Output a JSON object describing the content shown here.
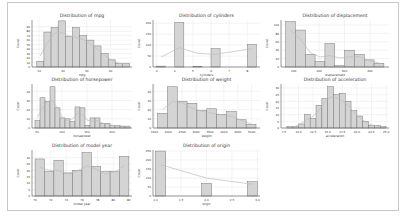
{
  "chart_data": [
    {
      "type": "bar",
      "title": "Distribution of mpg",
      "xlabel": "mpg",
      "ylabel": "Count",
      "bin_edges": [
        9,
        12.8,
        16.6,
        20.4,
        24.2,
        28,
        31.8,
        35.6,
        39.4,
        43.2,
        47
      ],
      "values": [
        13,
        78,
        88,
        103,
        68,
        88,
        70,
        60,
        47,
        30,
        16,
        8,
        8
      ],
      "bins": [
        [
          9,
          12
        ],
        [
          12,
          15
        ],
        [
          15,
          18
        ],
        [
          18,
          21
        ],
        [
          21,
          24
        ],
        [
          24,
          27
        ],
        [
          27,
          30
        ],
        [
          30,
          33
        ],
        [
          33,
          36
        ],
        [
          36,
          39
        ],
        [
          39,
          42
        ],
        [
          42,
          45
        ],
        [
          45,
          48
        ]
      ],
      "xticks": [
        "10",
        "20",
        "30",
        "40"
      ],
      "xtick_values": [
        10,
        20,
        30,
        40
      ],
      "yticks": [
        "0",
        "10",
        "20",
        "30",
        "40",
        "50",
        "60",
        "70",
        "80",
        "90"
      ],
      "ylim": [
        0,
        105
      ],
      "xlim": [
        7,
        49
      ],
      "kde": true
    },
    {
      "type": "bar",
      "title": "Distribution of cylinders",
      "xlabel": "cylinders",
      "ylabel": "Count",
      "bins": [
        [
          3,
          3.5
        ],
        [
          4,
          4.5
        ],
        [
          5,
          5.5
        ],
        [
          6,
          6.5
        ],
        [
          8,
          8.5
        ]
      ],
      "values": [
        4,
        204,
        3,
        84,
        103
      ],
      "xticks": [
        "3",
        "4",
        "5",
        "6",
        "7",
        "8"
      ],
      "xtick_values": [
        3,
        4,
        5,
        6,
        7,
        8
      ],
      "yticks": [
        "0",
        "50",
        "100",
        "150",
        "200"
      ],
      "ylim": [
        0,
        215
      ],
      "xlim": [
        2.8,
        8.7
      ],
      "kde": true
    },
    {
      "type": "bar",
      "title": "Distribution of displacement",
      "xlabel": "displacement",
      "ylabel": "Count",
      "bins": [
        [
          68,
          106.7
        ],
        [
          106.7,
          145.4
        ],
        [
          145.4,
          184.1
        ],
        [
          184.1,
          222.8
        ],
        [
          222.8,
          261.5
        ],
        [
          261.5,
          300.2
        ],
        [
          300.2,
          338.9
        ],
        [
          338.9,
          377.6
        ],
        [
          377.6,
          416.3
        ],
        [
          416.3,
          455
        ]
      ],
      "values": [
        108,
        88,
        30,
        13,
        56,
        3,
        40,
        30,
        17,
        9
      ],
      "xticks": [
        "100",
        "200",
        "300",
        "400"
      ],
      "xtick_values": [
        100,
        200,
        300,
        400
      ],
      "yticks": [
        "0",
        "20",
        "40",
        "60",
        "80",
        "100"
      ],
      "ylim": [
        0,
        112
      ],
      "xlim": [
        50,
        475
      ],
      "kde": true
    },
    {
      "type": "bar",
      "title": "Distribution of horsepower",
      "xlabel": "horsepower",
      "ylabel": "Count",
      "bins": [
        [
          46,
          56
        ],
        [
          56,
          66
        ],
        [
          66,
          76
        ],
        [
          76,
          86
        ],
        [
          86,
          96
        ],
        [
          96,
          106
        ],
        [
          106,
          116
        ],
        [
          116,
          126
        ],
        [
          126,
          136
        ],
        [
          136,
          146
        ],
        [
          146,
          156
        ],
        [
          156,
          166
        ],
        [
          166,
          176
        ],
        [
          176,
          186
        ],
        [
          186,
          196
        ],
        [
          196,
          206
        ],
        [
          206,
          216
        ],
        [
          216,
          226
        ],
        [
          226,
          236
        ]
      ],
      "values": [
        8,
        33,
        29,
        45,
        22,
        11,
        10,
        7,
        23,
        22,
        3,
        11,
        11,
        5,
        5,
        3,
        3,
        2,
        2
      ],
      "xticks": [
        "50",
        "100",
        "150",
        "200"
      ],
      "xtick_values": [
        50,
        100,
        150,
        200
      ],
      "yticks": [
        "0",
        "10",
        "20",
        "30",
        "40"
      ],
      "ylim": [
        0,
        48
      ],
      "xlim": [
        40,
        240
      ],
      "kde": true
    },
    {
      "type": "bar",
      "title": "Distribution of weight",
      "xlabel": "weight",
      "ylabel": "Count",
      "bins": [
        [
          1613,
          1967
        ],
        [
          1967,
          2322
        ],
        [
          2322,
          2676
        ],
        [
          2676,
          3030
        ],
        [
          3030,
          3384
        ],
        [
          3384,
          3739
        ],
        [
          3739,
          4093
        ],
        [
          4093,
          4447
        ],
        [
          4447,
          4802
        ],
        [
          4802,
          5156
        ]
      ],
      "values": [
        16,
        45,
        29,
        27,
        19,
        21,
        15,
        18,
        9,
        4
      ],
      "xticks": [
        "1500",
        "2000",
        "2500",
        "3000",
        "3500",
        "4000",
        "4500",
        "5000"
      ],
      "xtick_values": [
        1500,
        2000,
        2500,
        3000,
        3500,
        4000,
        4500,
        5000
      ],
      "yticks": [
        "0",
        "10",
        "20",
        "30",
        "40"
      ],
      "ylim": [
        0,
        48
      ],
      "xlim": [
        1450,
        5300
      ],
      "kde": true
    },
    {
      "type": "bar",
      "title": "Distribution of acceleration",
      "xlabel": "acceleration",
      "ylabel": "Count",
      "bins": [
        [
          8,
          9
        ],
        [
          9,
          10
        ],
        [
          10,
          11
        ],
        [
          11,
          12
        ],
        [
          12,
          13
        ],
        [
          13,
          14
        ],
        [
          14,
          15
        ],
        [
          15,
          16
        ],
        [
          16,
          17
        ],
        [
          17,
          18
        ],
        [
          18,
          19
        ],
        [
          19,
          20
        ],
        [
          20,
          21
        ],
        [
          21,
          22
        ],
        [
          22,
          23
        ],
        [
          23,
          24
        ],
        [
          24,
          25
        ]
      ],
      "values": [
        1,
        1,
        3,
        10,
        7,
        17,
        22,
        31,
        25,
        26,
        20,
        13,
        9,
        5,
        2,
        2,
        1
      ],
      "xticks": [
        "7.5",
        "10.0",
        "12.5",
        "15.0",
        "17.5",
        "20.0",
        "22.5",
        "25.0"
      ],
      "xtick_values": [
        7.5,
        10,
        12.5,
        15,
        17.5,
        20,
        22.5,
        25
      ],
      "yticks": [
        "0",
        "5",
        "10",
        "15",
        "20",
        "25",
        "30"
      ],
      "ylim": [
        0,
        33
      ],
      "xlim": [
        7,
        25.5
      ],
      "kde": true
    },
    {
      "type": "bar",
      "title": "Distribution of model year",
      "xlabel": "model year",
      "ylabel": "Count",
      "bins": [
        [
          70,
          71.2
        ],
        [
          71.2,
          72.4
        ],
        [
          72.4,
          73.6
        ],
        [
          73.6,
          74.8
        ],
        [
          74.8,
          76
        ],
        [
          76,
          77.2
        ],
        [
          77.2,
          78.4
        ],
        [
          78.4,
          79.6
        ],
        [
          79.6,
          80.8
        ],
        [
          80.8,
          82
        ]
      ],
      "values": [
        29,
        19,
        28,
        18,
        20,
        34,
        23,
        19,
        19,
        31
      ],
      "xticks": [
        "70",
        "72",
        "74",
        "76",
        "78",
        "80",
        "82"
      ],
      "xtick_values": [
        70,
        72,
        74,
        76,
        78,
        80,
        82
      ],
      "yticks": [
        "0",
        "5",
        "10",
        "15",
        "20",
        "25",
        "30"
      ],
      "ylim": [
        0,
        36
      ],
      "xlim": [
        69.6,
        82.4
      ],
      "kde": true
    },
    {
      "type": "bar",
      "title": "Distribution of origin",
      "xlabel": "origin",
      "ylabel": "Count",
      "bins": [
        [
          1,
          1.2
        ],
        [
          1.9,
          2.1
        ],
        [
          2.8,
          3.0
        ]
      ],
      "values": [
        249,
        70,
        79
      ],
      "xticks": [
        "1.0",
        "1.5",
        "2.0",
        "2.5",
        "3.0"
      ],
      "xtick_values": [
        1,
        1.5,
        2,
        2.5,
        3
      ],
      "yticks": [
        "0",
        "50",
        "100",
        "150",
        "200",
        "250"
      ],
      "ylim": [
        0,
        255
      ],
      "xlim": [
        0.95,
        3.05
      ],
      "kde": true
    }
  ]
}
